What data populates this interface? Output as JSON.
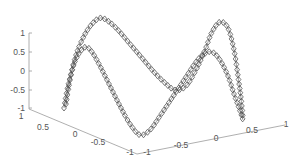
{
  "chart_data": {
    "type": "line3d",
    "title": "",
    "marker": "diamond",
    "line_color": "#555555",
    "background": "#ffffff",
    "axes": {
      "x": {
        "label": "",
        "range": [
          -1,
          1
        ],
        "ticks": [
          "-1",
          "-0.5",
          "0",
          "0.5",
          "1"
        ]
      },
      "y": {
        "label": "",
        "range": [
          -1,
          1
        ],
        "ticks": [
          "1",
          "0.5",
          "0",
          "-0.5",
          "-1"
        ]
      },
      "z": {
        "label": "",
        "range": [
          -1,
          1
        ],
        "ticks": [
          "-1",
          "-0.5",
          "0",
          "0.5",
          "1"
        ]
      }
    },
    "grid": false,
    "legend": null,
    "series": [
      {
        "name": "curve-back",
        "description": "sinusoid along the back edge: peaks near z=1 twice, dips to about z=-0.5 in the middle, ends at z=-1",
        "points_px": [
          [
            66,
            104
          ],
          [
            70,
            80
          ],
          [
            76,
            55
          ],
          [
            84,
            36
          ],
          [
            92,
            24
          ],
          [
            100,
            18
          ],
          [
            108,
            21
          ],
          [
            118,
            30
          ],
          [
            130,
            44
          ],
          [
            142,
            58
          ],
          [
            154,
            72
          ],
          [
            164,
            82
          ],
          [
            175,
            90
          ],
          [
            186,
            86
          ],
          [
            196,
            70
          ],
          [
            205,
            50
          ],
          [
            212,
            32
          ],
          [
            220,
            22
          ],
          [
            228,
            28
          ],
          [
            234,
            50
          ],
          [
            238,
            76
          ],
          [
            241,
            98
          ],
          [
            243,
            118
          ]
        ]
      },
      {
        "name": "curve-front",
        "description": "sinusoid along the front edge: peaks near z=0.5 twice, dips to about z=-1 in the middle, ends at z=-1",
        "points_px": [
          [
            64,
            108
          ],
          [
            68,
            86
          ],
          [
            74,
            64
          ],
          [
            80,
            52
          ],
          [
            86,
            47
          ],
          [
            92,
            52
          ],
          [
            100,
            66
          ],
          [
            110,
            86
          ],
          [
            120,
            106
          ],
          [
            130,
            124
          ],
          [
            140,
            135
          ],
          [
            150,
            130
          ],
          [
            160,
            116
          ],
          [
            172,
            98
          ],
          [
            184,
            80
          ],
          [
            196,
            62
          ],
          [
            204,
            54
          ],
          [
            212,
            52
          ],
          [
            220,
            60
          ],
          [
            228,
            76
          ],
          [
            234,
            94
          ],
          [
            239,
            108
          ],
          [
            243,
            120
          ]
        ]
      }
    ]
  },
  "axis_labels": {
    "z": [
      "1",
      "0.5",
      "0",
      "-0.5",
      "-1"
    ],
    "left_floor": [
      "1",
      "0.5",
      "0",
      "-0.5",
      "-1"
    ],
    "right_floor": [
      "-1",
      "-0.5",
      "0",
      "0.5",
      "1"
    ]
  }
}
